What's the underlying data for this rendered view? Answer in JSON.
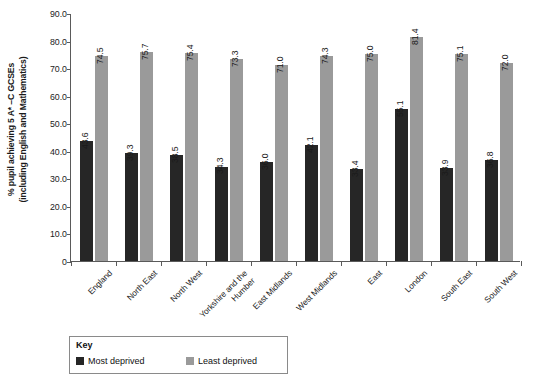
{
  "chart_data": {
    "type": "bar",
    "title": "",
    "xlabel": "",
    "ylabel": "% pupil achieving 5 A* –C GCSEs\n(including English and Mathematics)",
    "ylim": [
      0,
      90
    ],
    "ytick_labels": [
      "90.0",
      "80.0",
      "70.0",
      "60.0",
      "50.0",
      "40.0",
      "30.0",
      "20.0",
      "10.0",
      "0"
    ],
    "ytick_values": [
      90,
      80,
      70,
      60,
      50,
      40,
      30,
      20,
      10,
      0
    ],
    "grid": false,
    "legend_position": "bottom-left",
    "categories": [
      "England",
      "North East",
      "North West",
      "Yorkshire and the\nHumber",
      "East Midlands",
      "West Midlands",
      "East",
      "London",
      "South East",
      "South West"
    ],
    "series": [
      {
        "name": "Most deprived",
        "color": "#262626",
        "values": [
          43.6,
          39.3,
          38.5,
          34.3,
          36.0,
          42.1,
          33.4,
          55.1,
          33.9,
          36.8
        ],
        "labels": [
          "43.6",
          "39.3",
          "38.5",
          "34.3",
          "36.0",
          "42.1",
          "33.4",
          "55.1",
          "33.9",
          "36.8"
        ]
      },
      {
        "name": "Least deprived",
        "color": "#9a9a9a",
        "values": [
          74.5,
          75.7,
          75.4,
          73.3,
          71.0,
          74.3,
          75.0,
          81.4,
          75.1,
          72.0
        ],
        "labels": [
          "74.5",
          "75.7",
          "75.4",
          "73.3",
          "71.0",
          "74.3",
          "75.0",
          "81.4",
          "75.1",
          "72.0"
        ]
      }
    ]
  },
  "legend": {
    "title": "Key",
    "items": [
      {
        "label": "Most deprived",
        "color": "#262626"
      },
      {
        "label": "Least deprived",
        "color": "#9a9a9a"
      }
    ]
  }
}
